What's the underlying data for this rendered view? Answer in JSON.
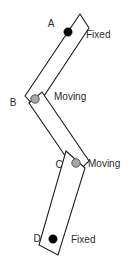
{
  "figure": {
    "name": "four-bar-linkage-diagram",
    "background_color": "#ffffff",
    "outline_color": "#222222",
    "width": 135,
    "height": 261
  },
  "vertices": {
    "a": {
      "label": "A",
      "label_x": 51,
      "label_y": 24,
      "joint_x": 68,
      "joint_y": 32,
      "joint_r": 4.2,
      "joint_type": "fixed"
    },
    "b": {
      "label": "B",
      "label_x": 13,
      "label_y": 103,
      "joint_x": 35,
      "joint_y": 99,
      "joint_r": 4.2,
      "joint_type": "moving"
    },
    "c": {
      "label": "C",
      "label_x": 59,
      "label_y": 165,
      "joint_x": 76,
      "joint_y": 163,
      "joint_r": 4.2,
      "joint_type": "moving"
    },
    "d": {
      "label": "D",
      "label_x": 37,
      "label_y": 239,
      "joint_x": 53,
      "joint_y": 239,
      "joint_r": 4.2,
      "joint_type": "fixed"
    }
  },
  "annotations": [
    {
      "id": "fixed-top",
      "text": "Fixed",
      "x": 86,
      "y": 35,
      "for": "A"
    },
    {
      "id": "moving-upper",
      "text": "Moving",
      "x": 54,
      "y": 97,
      "for": "B"
    },
    {
      "id": "moving-lower",
      "text": "Moving",
      "x": 88,
      "y": 164,
      "for": "C"
    },
    {
      "id": "fixed-bottom",
      "text": "Fixed",
      "x": 71,
      "y": 240,
      "for": "D"
    }
  ],
  "links": [
    {
      "id": "link-ab",
      "name": "link-a-b",
      "from": "A",
      "to": "B",
      "points": "80,14 89,28 36,108 25,96"
    },
    {
      "id": "link-bc",
      "name": "link-b-c",
      "from": "B",
      "to": "C",
      "points": "29,103 42,92 89,161 77,173"
    },
    {
      "id": "link-cd",
      "name": "link-c-d",
      "from": "C",
      "to": "D",
      "points": "66,151 85,168 58,255 39,245"
    }
  ],
  "colors": {
    "fixed_joint": "#000000",
    "moving_joint": "#a8a8a8",
    "moving_joint_stroke": "#555555",
    "link_stroke": "#222222",
    "link_fill": "#ffffff",
    "text": "#2b2b2b"
  }
}
